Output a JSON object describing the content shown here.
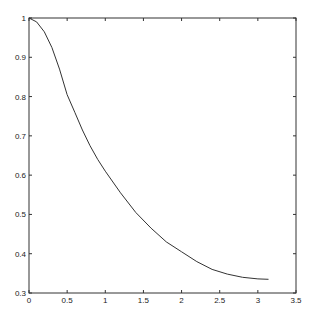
{
  "chart_data": {
    "type": "line",
    "title": "",
    "xlabel": "",
    "ylabel": "",
    "xlim": [
      0,
      3.5
    ],
    "ylim": [
      0.3,
      1
    ],
    "grid": false,
    "legend": null,
    "x_ticks": [
      "0",
      "0.5",
      "1",
      "1.5",
      "2",
      "2.5",
      "3",
      "3.5"
    ],
    "y_ticks": [
      "0.3",
      "0.4",
      "0.5",
      "0.6",
      "0.7",
      "0.8",
      "0.9",
      "1"
    ],
    "series": [
      {
        "name": "curve",
        "color": "#333333",
        "x": [
          0,
          0.1,
          0.2,
          0.3,
          0.4,
          0.5,
          0.6,
          0.7,
          0.8,
          0.9,
          1.0,
          1.2,
          1.4,
          1.6,
          1.8,
          2.0,
          2.2,
          2.4,
          2.6,
          2.8,
          3.0,
          3.14
        ],
        "y": [
          1.0,
          0.99,
          0.965,
          0.925,
          0.87,
          0.805,
          0.76,
          0.715,
          0.675,
          0.64,
          0.61,
          0.555,
          0.505,
          0.465,
          0.43,
          0.405,
          0.38,
          0.36,
          0.348,
          0.34,
          0.336,
          0.335
        ]
      }
    ]
  }
}
